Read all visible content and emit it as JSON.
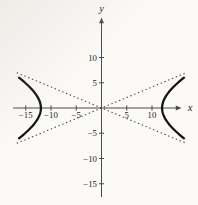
{
  "colors": {
    "background": "#fbfaf6",
    "axis": "#4a4a48",
    "curve": "#141414",
    "asymptote": "#4c4c4a",
    "text": "#1c1c1c"
  },
  "chart_data": {
    "type": "line",
    "xlabel": "x",
    "ylabel": "y",
    "xlim": [
      -20,
      19
    ],
    "ylim": [
      -19,
      21
    ],
    "grid": false,
    "x_ticks": [
      {
        "value": -15,
        "label": "−15"
      },
      {
        "value": -10,
        "label": "−10"
      },
      {
        "value": -5,
        "label": "−5"
      },
      {
        "value": 5,
        "label": "5"
      },
      {
        "value": 10,
        "label": "10"
      }
    ],
    "y_ticks": [
      {
        "value": 10,
        "label": "10"
      },
      {
        "value": 5,
        "label": "5"
      },
      {
        "value": -5,
        "label": "−5"
      },
      {
        "value": -10,
        "label": "−10"
      },
      {
        "value": -15,
        "label": "−15"
      }
    ],
    "hyperbola": {
      "center": [
        0,
        0
      ],
      "opens": "left-right",
      "vertices": [
        [
          -12,
          0
        ],
        [
          12,
          0
        ]
      ],
      "a": 12,
      "b_visual": 6.5,
      "y_extent": 6
    },
    "asymptote_slope_magnitude": 0.4167,
    "series": [
      {
        "name": "hyperbola-left-branch",
        "style": "solid",
        "branch": "left",
        "points": [
          [
            -16.33,
            -6
          ],
          [
            -15.14,
            -5
          ],
          [
            -14.09,
            -4
          ],
          [
            -13.22,
            -3
          ],
          [
            -12.56,
            -2
          ],
          [
            -12.14,
            -1
          ],
          [
            -12,
            0
          ],
          [
            -12.14,
            1
          ],
          [
            -12.56,
            2
          ],
          [
            -13.22,
            3
          ],
          [
            -14.09,
            4
          ],
          [
            -15.14,
            5
          ],
          [
            -16.33,
            6
          ]
        ]
      },
      {
        "name": "hyperbola-right-branch",
        "style": "solid",
        "branch": "right",
        "points": [
          [
            16.33,
            -6
          ],
          [
            15.14,
            -5
          ],
          [
            14.09,
            -4
          ],
          [
            13.22,
            -3
          ],
          [
            12.56,
            -2
          ],
          [
            12.14,
            -1
          ],
          [
            12,
            0
          ],
          [
            12.14,
            1
          ],
          [
            12.56,
            2
          ],
          [
            13.22,
            3
          ],
          [
            14.09,
            4
          ],
          [
            15.14,
            5
          ],
          [
            16.33,
            6
          ]
        ]
      },
      {
        "name": "asymptote-rising",
        "style": "dotted",
        "points": [
          [
            -16.7,
            -6.96
          ],
          [
            16.7,
            6.96
          ]
        ]
      },
      {
        "name": "asymptote-falling",
        "style": "dotted",
        "points": [
          [
            -16.7,
            6.96
          ],
          [
            16.7,
            -6.96
          ]
        ]
      }
    ]
  }
}
